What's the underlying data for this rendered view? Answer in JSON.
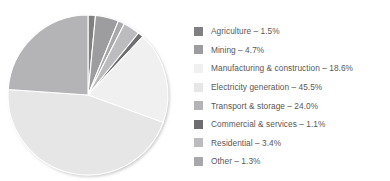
{
  "figure": {
    "background_color": "#ffffff",
    "width": 390,
    "height": 181
  },
  "chart_data": {
    "type": "pie",
    "title": "",
    "subtitle": "",
    "xlabel": "",
    "ylabel": "",
    "grid": false,
    "legend_position": "right",
    "total_percent": "100.1%",
    "value_unit": "%",
    "start_angle_deg": 0,
    "direction": "clockwise",
    "center": {
      "x": 88,
      "y": 95
    },
    "radius": 80,
    "categories": [
      "Agriculture",
      "Mining",
      "Manufacturing & construction",
      "Electricity generation",
      "Transport & storage",
      "Commercial & services",
      "Residential",
      "Other"
    ],
    "values": [
      1.5,
      4.7,
      18.6,
      45.5,
      24.0,
      1.1,
      3.4,
      1.3
    ],
    "value_labels": [
      "1.5%",
      "4.7%",
      "18.6%",
      "45.5%",
      "24.0%",
      "1.1%",
      "3.4%",
      "1.3%"
    ],
    "colors": [
      "#808082",
      "#9d9d9f",
      "#f0f0f0",
      "#e6e6e6",
      "#b4b4b6",
      "#6e6e70",
      "#bcbcbe",
      "#a8a8aa"
    ],
    "slice_separator_color": "#ffffff",
    "slice_separator_width": 1.1,
    "slices": [
      {
        "label": "Agriculture",
        "value": 1.5,
        "value_label": "1.5%",
        "color": "#808082",
        "start_deg": 0.0,
        "end_deg": 5.4
      },
      {
        "label": "Mining",
        "value": 4.7,
        "value_label": "4.7%",
        "color": "#9d9d9f",
        "start_deg": 5.4,
        "end_deg": 22.3
      },
      {
        "label": "Other",
        "value": 1.3,
        "value_label": "1.3%",
        "color": "#a8a8aa",
        "start_deg": 22.3,
        "end_deg": 27.0
      },
      {
        "label": "Residential",
        "value": 3.4,
        "value_label": "3.4%",
        "color": "#bcbcbe",
        "start_deg": 27.0,
        "end_deg": 39.2
      },
      {
        "label": "Commercial & services",
        "value": 1.1,
        "value_label": "1.1%",
        "color": "#6e6e70",
        "start_deg": 39.2,
        "end_deg": 43.2
      },
      {
        "label": "Manufacturing & construction",
        "value": 18.6,
        "value_label": "18.6%",
        "color": "#f0f0f0",
        "start_deg": 43.2,
        "end_deg": 110.1
      },
      {
        "label": "Electricity generation",
        "value": 45.5,
        "value_label": "45.5%",
        "color": "#e6e6e6",
        "start_deg": 110.1,
        "end_deg": 273.9
      },
      {
        "label": "Transport & storage",
        "value": 24.0,
        "value_label": "24.0%",
        "color": "#b4b4b6",
        "start_deg": 273.9,
        "end_deg": 360.0
      }
    ]
  },
  "legend": {
    "items": [
      {
        "label": "Agriculture – 1.5%",
        "color": "#808082",
        "name": "agriculture"
      },
      {
        "label": "Mining – 4.7%",
        "color": "#9d9d9f",
        "name": "mining"
      },
      {
        "label": "Manufacturing & construction – 18.6%",
        "color": "#f0f0f0",
        "name": "manufacturing-construction"
      },
      {
        "label": "Electricity generation – 45.5%",
        "color": "#e6e6e6",
        "name": "electricity-generation"
      },
      {
        "label": "Transport & storage – 24.0%",
        "color": "#b4b4b6",
        "name": "transport-storage"
      },
      {
        "label": "Commercial & services – 1.1%",
        "color": "#6e6e70",
        "name": "commercial-services"
      },
      {
        "label": "Residential – 3.4%",
        "color": "#bcbcbe",
        "name": "residential"
      },
      {
        "label": "Other – 1.3%",
        "color": "#a8a8aa",
        "name": "other"
      }
    ]
  }
}
